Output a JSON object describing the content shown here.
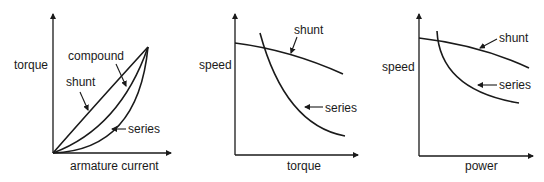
{
  "charts": [
    {
      "id": "torque-vs-armature-current",
      "ylabel": "torque",
      "xlabel": "armature current",
      "curves": [
        {
          "name": "shunt",
          "label": "shunt"
        },
        {
          "name": "compound",
          "label": "compound"
        },
        {
          "name": "series",
          "label": "series"
        }
      ]
    },
    {
      "id": "speed-vs-torque",
      "ylabel": "speed",
      "xlabel": "torque",
      "curves": [
        {
          "name": "shunt",
          "label": "shunt"
        },
        {
          "name": "series",
          "label": "series"
        }
      ]
    },
    {
      "id": "speed-vs-power",
      "ylabel": "speed",
      "xlabel": "power",
      "curves": [
        {
          "name": "shunt",
          "label": "shunt"
        },
        {
          "name": "series",
          "label": "series"
        }
      ]
    }
  ],
  "colors": {
    "ink": "#1a1a1a",
    "background": "#ffffff"
  }
}
